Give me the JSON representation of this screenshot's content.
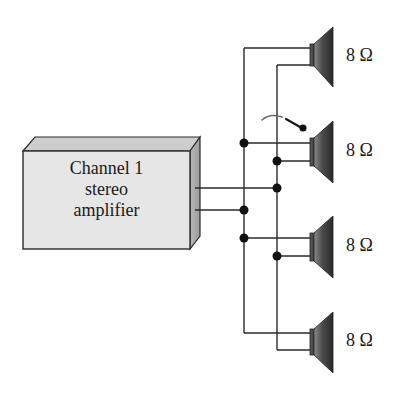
{
  "diagram": {
    "type": "circuit-wiring",
    "amplifier": {
      "label_lines": [
        "Channel 1",
        "stereo",
        "amplifier"
      ],
      "face_color": "#e4e4e4",
      "top_color": "#c8c8c8",
      "side_color": "#a8a8a8"
    },
    "speakers": [
      {
        "id": "speaker-1",
        "impedance": "8 Ω"
      },
      {
        "id": "speaker-2",
        "impedance": "8 Ω"
      },
      {
        "id": "speaker-3",
        "impedance": "8 Ω"
      },
      {
        "id": "speaker-4",
        "impedance": "8 Ω"
      }
    ],
    "colors": {
      "wire": "#2a2a2a",
      "junction": "#111111",
      "speaker_dark": "#2e2e2e",
      "speaker_light": "#8a8a8a"
    }
  }
}
